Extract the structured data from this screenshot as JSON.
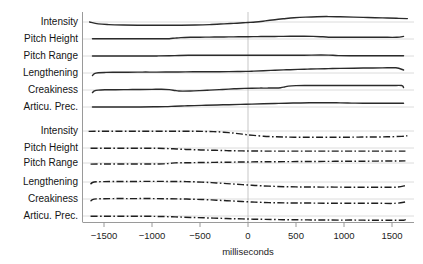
{
  "chart_data": {
    "type": "line",
    "title": "",
    "xlabel": "milliseconds",
    "ylabel": "",
    "xlim": [
      -1650,
      1660
    ],
    "xticks": [
      -1500,
      -1000,
      -500,
      0,
      500,
      1000,
      1500
    ],
    "xticklabels": [
      "−1500",
      "−1000",
      "−500",
      "0",
      "500",
      "1000",
      "1500"
    ],
    "grid": false,
    "legend": "none",
    "annotations": [
      "vertical reference line at 0 milliseconds"
    ],
    "panels": [
      {
        "name": "upper-panel",
        "linestyle": "solid",
        "series": [
          {
            "name": "Intensity",
            "label": "Intensity",
            "baseline_y": 22,
            "x": [
              -1650,
              -1560,
              -1450,
              -1300,
              -1150,
              -1000,
              -850,
              -700,
              -550,
              -400,
              -250,
              -150,
              -50,
              0,
              80,
              180,
              280,
              380,
              480,
              600,
              720,
              840,
              960,
              1100,
              1250,
              1400,
              1550,
              1660
            ],
            "y": [
              0.0,
              1.9,
              2.6,
              3.0,
              3.2,
              3.3,
              3.3,
              3.2,
              3.0,
              2.6,
              1.9,
              1.4,
              0.8,
              0.5,
              0.0,
              -1.1,
              -2.3,
              -3.3,
              -4.2,
              -4.9,
              -5.3,
              -5.4,
              -5.2,
              -4.9,
              -4.5,
              -4.1,
              -3.7,
              -3.4
            ]
          },
          {
            "name": "Pitch Height",
            "label": "Pitch Height",
            "baseline_y": 39,
            "x": [
              -1620,
              -1500,
              -1350,
              -1200,
              -1050,
              -900,
              -820,
              -760,
              -700,
              -600,
              -500,
              -400,
              -300,
              -200,
              -100,
              0,
              100,
              200,
              320,
              440,
              560,
              680,
              780,
              860,
              960,
              1100,
              1250,
              1400,
              1550,
              1620
            ],
            "y": [
              -0.2,
              -0.2,
              -0.2,
              -0.2,
              -0.2,
              -0.2,
              -0.3,
              -0.9,
              -1.4,
              -1.7,
              -1.8,
              -1.9,
              -2.0,
              -2.1,
              -2.2,
              -2.3,
              -2.4,
              -2.5,
              -2.6,
              -2.7,
              -2.7,
              -2.6,
              -2.2,
              -1.8,
              -1.7,
              -1.7,
              -1.7,
              -1.7,
              -1.7,
              -2.6
            ]
          },
          {
            "name": "Pitch Range",
            "label": "Pitch Range",
            "baseline_y": 56,
            "x": [
              -1620,
              -1450,
              -1280,
              -1100,
              -950,
              -820,
              -720,
              -620,
              -520,
              -400,
              -280,
              -160,
              -40,
              60,
              180,
              300,
              420,
              540,
              660,
              760,
              840,
              940,
              1060,
              1200,
              1350,
              1500,
              1620
            ],
            "y": [
              -0.1,
              -0.1,
              -0.1,
              -0.1,
              -0.1,
              -0.2,
              -0.5,
              -0.7,
              -0.8,
              -0.8,
              -0.8,
              -0.8,
              -0.8,
              -0.8,
              -0.8,
              -0.8,
              -0.8,
              -0.8,
              -0.9,
              -1.0,
              -0.9,
              -0.4,
              -0.2,
              -0.2,
              -0.2,
              -0.2,
              -0.2
            ]
          },
          {
            "name": "Lengthening",
            "label": "Lengthening",
            "baseline_y": 73,
            "x": [
              -1620,
              -1600,
              -1560,
              -1480,
              -1380,
              -1250,
              -1100,
              -950,
              -800,
              -650,
              -500,
              -350,
              -200,
              -100,
              -20,
              60,
              160,
              280,
              400,
              520,
              620,
              720,
              840,
              960,
              1100,
              1250,
              1400,
              1540,
              1620
            ],
            "y": [
              2.6,
              0.6,
              -0.3,
              -0.6,
              -0.7,
              -0.8,
              -0.9,
              -0.9,
              -1.0,
              -1.1,
              -1.2,
              -1.3,
              -1.4,
              -1.5,
              -1.6,
              -1.9,
              -2.3,
              -2.8,
              -3.2,
              -3.6,
              -3.9,
              -4.1,
              -4.4,
              -4.6,
              -4.8,
              -5.0,
              -5.1,
              -5.2,
              -3.0
            ]
          },
          {
            "name": "Creakiness",
            "label": "Creakiness",
            "baseline_y": 90,
            "x": [
              -1620,
              -1600,
              -1560,
              -1480,
              -1380,
              -1250,
              -1120,
              -1000,
              -900,
              -820,
              -760,
              -720,
              -680,
              -600,
              -500,
              -400,
              -300,
              -200,
              -120,
              -40,
              40,
              120,
              200,
              280,
              340,
              380,
              420,
              500,
              620,
              760,
              900,
              1050,
              1200,
              1350,
              1500,
              1600,
              1620
            ],
            "y": [
              2.6,
              0.9,
              0.1,
              -0.2,
              -0.3,
              -0.4,
              -0.5,
              -0.6,
              -0.7,
              -0.4,
              0.5,
              1.0,
              1.1,
              1.0,
              0.6,
              0.1,
              -0.4,
              -0.9,
              -1.3,
              -1.6,
              -1.8,
              -1.9,
              -1.9,
              -2.0,
              -2.3,
              -3.0,
              -3.9,
              -4.4,
              -4.5,
              -4.5,
              -4.5,
              -4.5,
              -4.5,
              -4.5,
              -4.5,
              -4.5,
              -2.6
            ]
          },
          {
            "name": "Articu. Prec.",
            "label": "Articu. Prec.",
            "baseline_y": 107,
            "x": [
              -1620,
              -1450,
              -1280,
              -1120,
              -980,
              -860,
              -760,
              -660,
              -560,
              -440,
              -320,
              -200,
              -80,
              40,
              160,
              280,
              400,
              520,
              640,
              760,
              860,
              960,
              1080,
              1200,
              1350,
              1500,
              1620
            ],
            "y": [
              -0.1,
              -0.1,
              -0.1,
              -0.1,
              -0.2,
              -0.4,
              -0.8,
              -1.1,
              -1.4,
              -1.7,
              -2.0,
              -2.3,
              -2.6,
              -2.9,
              -3.2,
              -3.5,
              -3.8,
              -4.0,
              -4.2,
              -4.3,
              -4.3,
              -4.1,
              -3.9,
              -3.8,
              -3.8,
              -3.8,
              -3.8
            ]
          }
        ]
      },
      {
        "name": "lower-panel",
        "linestyle": "dashdot",
        "series": [
          {
            "name": "Intensity",
            "label": "Intensity",
            "baseline_y": 131,
            "x": [
              -1660,
              -1560,
              -1420,
              -1280,
              -1140,
              -1000,
              -860,
              -720,
              -580,
              -460,
              -360,
              -280,
              -200,
              -140,
              -80,
              -20,
              60,
              160,
              260,
              360,
              480,
              600,
              720,
              860,
              1000,
              1150,
              1300,
              1450,
              1600,
              1660
            ],
            "y": [
              0.4,
              0.3,
              0.3,
              0.3,
              0.3,
              0.3,
              0.3,
              0.3,
              0.3,
              0.4,
              0.6,
              1.0,
              1.6,
              2.2,
              2.9,
              3.6,
              4.4,
              5.2,
              5.7,
              6.0,
              6.2,
              6.3,
              6.3,
              6.3,
              6.2,
              6.1,
              6.0,
              5.8,
              5.4,
              4.7
            ]
          },
          {
            "name": "Pitch Height",
            "label": "Pitch Height",
            "baseline_y": 148,
            "x": [
              -1640,
              -1500,
              -1360,
              -1220,
              -1080,
              -960,
              -860,
              -780,
              -700,
              -620,
              -540,
              -460,
              -380,
              -300,
              -220,
              -140,
              -60,
              40,
              160,
              300,
              440,
              600,
              760,
              920,
              1080,
              1250,
              1420,
              1580,
              1640
            ],
            "y": [
              0.2,
              0.2,
              0.2,
              0.2,
              0.2,
              0.3,
              0.5,
              0.8,
              1.2,
              1.5,
              1.8,
              2.0,
              2.2,
              2.4,
              2.6,
              2.8,
              2.9,
              3.0,
              3.1,
              3.1,
              3.1,
              3.1,
              3.1,
              3.1,
              3.1,
              3.1,
              3.1,
              3.1,
              3.1
            ]
          },
          {
            "name": "Pitch Range",
            "label": "Pitch Range",
            "baseline_y": 163,
            "x": [
              -1640,
              -1520,
              -1400,
              -1280,
              -1160,
              -1040,
              -940,
              -880,
              -840,
              -800,
              -760,
              -700,
              -620,
              -540,
              -460,
              -380,
              -300,
              -220,
              -140,
              -60,
              40,
              160,
              300,
              460,
              620,
              800,
              980,
              1160,
              1350,
              1540,
              1640
            ],
            "y": [
              1.1,
              1.0,
              1.0,
              1.0,
              1.0,
              1.0,
              1.0,
              0.9,
              0.6,
              0.2,
              -0.1,
              -0.2,
              -0.3,
              -0.4,
              -0.5,
              -0.6,
              -0.7,
              -0.8,
              -0.9,
              -1.0,
              -1.1,
              -1.2,
              -1.3,
              -1.4,
              -1.5,
              -1.6,
              -1.7,
              -1.8,
              -1.9,
              -2.0,
              -2.1
            ]
          },
          {
            "name": "Lengthening",
            "label": "Lengthening",
            "baseline_y": 182,
            "x": [
              -1640,
              -1620,
              -1580,
              -1500,
              -1400,
              -1280,
              -1140,
              -1000,
              -860,
              -720,
              -600,
              -480,
              -380,
              -300,
              -220,
              -140,
              -60,
              40,
              140,
              260,
              380,
              500,
              620,
              760,
              900,
              1060,
              1220,
              1400,
              1560,
              1640
            ],
            "y": [
              2.2,
              0.5,
              -0.2,
              -0.4,
              -0.5,
              -0.5,
              -0.6,
              -0.6,
              -0.6,
              -0.5,
              -0.3,
              0.1,
              0.6,
              1.1,
              1.6,
              2.1,
              2.6,
              3.2,
              3.8,
              4.3,
              4.7,
              4.9,
              5.0,
              5.1,
              5.1,
              5.2,
              5.2,
              5.2,
              5.1,
              3.6
            ]
          },
          {
            "name": "Creakiness",
            "label": "Creakiness",
            "baseline_y": 199,
            "x": [
              -1640,
              -1620,
              -1580,
              -1500,
              -1400,
              -1280,
              -1140,
              -1000,
              -860,
              -720,
              -600,
              -480,
              -380,
              -300,
              -220,
              -140,
              -60,
              40,
              140,
              260,
              380,
              520,
              680,
              840,
              1000,
              1180,
              1360,
              1540,
              1640
            ],
            "y": [
              2.2,
              0.6,
              -0.1,
              -0.3,
              -0.4,
              -0.4,
              -0.4,
              -0.4,
              -0.3,
              -0.1,
              0.2,
              0.5,
              0.9,
              1.3,
              1.7,
              2.1,
              2.5,
              3.0,
              3.4,
              3.7,
              3.9,
              4.0,
              4.1,
              4.2,
              4.2,
              4.3,
              4.3,
              4.3,
              2.9
            ]
          },
          {
            "name": "Articu. Prec.",
            "label": "Articu. Prec.",
            "baseline_y": 216,
            "x": [
              -1640,
              -1500,
              -1360,
              -1220,
              -1080,
              -960,
              -860,
              -760,
              -660,
              -560,
              -460,
              -360,
              -260,
              -160,
              -60,
              60,
              180,
              320,
              460,
              620,
              780,
              940,
              1120,
              1300,
              1480,
              1620,
              1640
            ],
            "y": [
              0.3,
              0.3,
              0.3,
              0.3,
              0.3,
              0.4,
              0.6,
              0.9,
              1.2,
              1.5,
              1.8,
              2.1,
              2.4,
              2.7,
              2.9,
              3.2,
              3.4,
              3.6,
              3.8,
              3.9,
              4.0,
              4.1,
              4.1,
              4.2,
              4.2,
              4.2,
              3.0
            ]
          }
        ]
      }
    ]
  },
  "colors": {
    "line": "#2b2b2b",
    "baseline": "#d3d3d3",
    "axis": "#8f8f8f",
    "zero_line": "#b9b9b9",
    "background": "#ffffff",
    "text": "#1a1a1a"
  }
}
